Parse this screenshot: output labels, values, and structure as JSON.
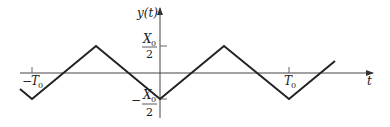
{
  "figure": {
    "type": "triangular waveform plot",
    "y_axis_label": "y(t)",
    "x_axis_label": "t",
    "y_ticks": [
      {
        "label_num": "X",
        "label_sub": "0",
        "label_den": "2",
        "sign": "",
        "value": "X0/2"
      },
      {
        "label_num": "X",
        "label_sub": "0",
        "label_den": "2",
        "sign": "−",
        "value": "-X0/2"
      }
    ],
    "x_ticks": [
      {
        "label": "T",
        "sub": "0",
        "sign": "−",
        "value": "-T0"
      },
      {
        "label": "T",
        "sub": "0",
        "sign": "",
        "value": "T0"
      }
    ],
    "waveform_points": [
      [
        20,
        89
      ],
      [
        32,
        99
      ],
      [
        96,
        46
      ],
      [
        160,
        99
      ],
      [
        224,
        46
      ],
      [
        289,
        99
      ],
      [
        335,
        61
      ]
    ],
    "stroke_color": "#222222"
  }
}
